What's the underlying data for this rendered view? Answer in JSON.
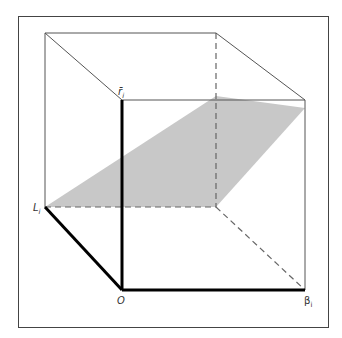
{
  "diagram": {
    "type": "3d-cube-with-plane",
    "labels": {
      "top": "r̄",
      "top_sub": "i",
      "left": "L",
      "left_sub": "i",
      "origin": "O",
      "right": "β",
      "right_sub": "i"
    },
    "colors": {
      "plane": "#c8c8c8",
      "edge": "#555555",
      "axis": "#000000",
      "frame": "#444444"
    }
  }
}
